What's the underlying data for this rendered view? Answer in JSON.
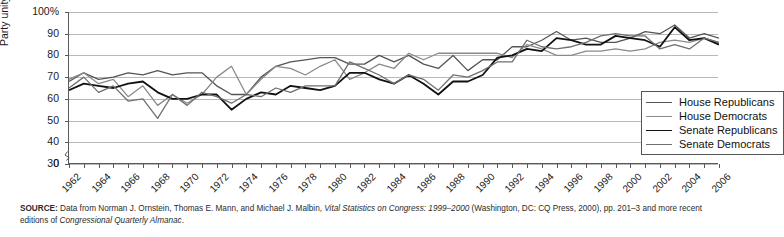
{
  "chart_data": {
    "type": "line",
    "title": "",
    "xlabel": "",
    "ylabel": "Party unity score",
    "ylim": [
      30,
      100
    ],
    "ytick_labels": [
      "100%",
      "90",
      "80",
      "70",
      "60",
      "50",
      "40",
      "30",
      "0"
    ],
    "ytick_values": [
      100,
      90,
      80,
      70,
      60,
      50,
      40,
      30,
      0
    ],
    "axis_break": true,
    "grid": true,
    "legend_position": "lower-right inside",
    "x": [
      1962,
      1963,
      1964,
      1965,
      1966,
      1967,
      1968,
      1969,
      1970,
      1971,
      1972,
      1973,
      1974,
      1975,
      1976,
      1977,
      1978,
      1979,
      1980,
      1981,
      1982,
      1983,
      1984,
      1985,
      1986,
      1987,
      1988,
      1989,
      1990,
      1991,
      1992,
      1993,
      1994,
      1995,
      1996,
      1997,
      1998,
      1999,
      2000,
      2001,
      2002,
      2003,
      2004,
      2005,
      2006
    ],
    "xtick_labels": [
      "1962",
      "1964",
      "1966",
      "1968",
      "1970",
      "1972",
      "1974",
      "1976",
      "1978",
      "1980",
      "1982",
      "1984",
      "1986",
      "1988",
      "1990",
      "1992",
      "1994",
      "1996",
      "1998",
      "2000",
      "2002",
      "2004",
      "2006"
    ],
    "series": [
      {
        "name": "House Republicans",
        "color": "#555555",
        "width": 1.3,
        "values": [
          68,
          72,
          69,
          70,
          72,
          71,
          73,
          71,
          72,
          72,
          66,
          62,
          62,
          70,
          75,
          77,
          78,
          79,
          79,
          76,
          76,
          80,
          77,
          80,
          76,
          74,
          80,
          73,
          78,
          78,
          84,
          84,
          87,
          91,
          87,
          88,
          86,
          86,
          88,
          91,
          90,
          94,
          88,
          90,
          88
        ]
      },
      {
        "name": "House Democrats",
        "color": "#8a8a8a",
        "width": 1.3,
        "values": [
          69,
          72,
          67,
          69,
          61,
          66,
          57,
          62,
          58,
          62,
          70,
          75,
          62,
          69,
          75,
          74,
          71,
          75,
          78,
          69,
          72,
          76,
          74,
          81,
          78,
          81,
          81,
          81,
          81,
          81,
          79,
          85,
          83,
          80,
          80,
          82,
          82,
          83,
          82,
          83,
          86,
          87,
          86,
          88,
          86
        ]
      },
      {
        "name": "Senate Republicans",
        "color": "#111111",
        "width": 1.8,
        "values": [
          64,
          67,
          66,
          65,
          67,
          68,
          63,
          60,
          60,
          62,
          62,
          55,
          60,
          63,
          62,
          66,
          65,
          64,
          66,
          72,
          72,
          69,
          67,
          71,
          67,
          62,
          68,
          68,
          71,
          79,
          80,
          83,
          82,
          88,
          87,
          85,
          85,
          89,
          88,
          87,
          84,
          93,
          87,
          88,
          85
        ]
      },
      {
        "name": "Senate Democrats",
        "color": "#6f6f6f",
        "width": 1.3,
        "values": [
          65,
          70,
          63,
          66,
          59,
          60,
          51,
          62,
          57,
          63,
          61,
          58,
          62,
          61,
          65,
          63,
          66,
          66,
          66,
          77,
          74,
          71,
          67,
          71,
          69,
          64,
          71,
          70,
          73,
          77,
          77,
          87,
          84,
          83,
          84,
          86,
          89,
          90,
          89,
          89,
          83,
          85,
          83,
          88,
          86
        ]
      }
    ]
  },
  "legend": {
    "items": [
      {
        "label": "House Republicans"
      },
      {
        "label": "House Democrats"
      },
      {
        "label": "Senate Republicans"
      },
      {
        "label": "Senate Democrats"
      }
    ]
  },
  "source": {
    "prefix": "SOURCE:",
    "text_1": " Data from Norman J. Ornstein, Thomas E. Mann, and Michael J. Malbin, ",
    "italic_1": "Vital Statistics on Congress: 1999–2000",
    "text_2": " (Washington, DC: CQ Press, 2000), pp. 201–3 and more recent editions of ",
    "italic_2": "Congressional Quarterly Almanac",
    "text_3": "."
  }
}
